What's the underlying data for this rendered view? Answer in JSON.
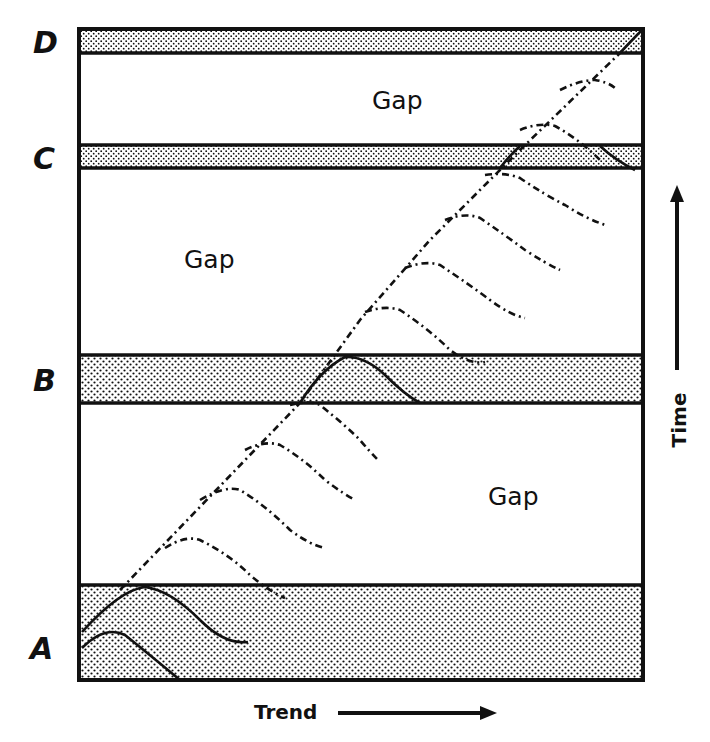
{
  "diagram": {
    "horizons": [
      {
        "id": "A",
        "label": "A"
      },
      {
        "id": "B",
        "label": "B"
      },
      {
        "id": "C",
        "label": "C"
      },
      {
        "id": "D",
        "label": "D"
      }
    ],
    "gaps": [
      {
        "label": "Gap",
        "between": "C-D"
      },
      {
        "label": "Gap",
        "between": "B-C"
      },
      {
        "label": "Gap",
        "between": "A-B"
      }
    ],
    "axes": {
      "x_label": "Trend",
      "y_label": "Time"
    },
    "colors": {
      "ink": "#111111",
      "background": "#ffffff"
    }
  }
}
